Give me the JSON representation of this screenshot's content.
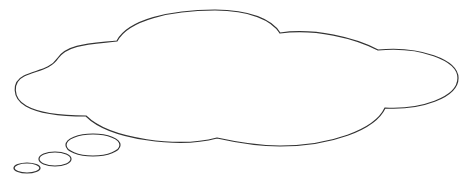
{
  "diagram": {
    "type": "thought-bubble",
    "stroke_color": "#333333",
    "fill_color": "#ffffff",
    "background": "#ffffff",
    "text": ""
  }
}
